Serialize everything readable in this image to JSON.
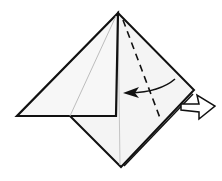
{
  "diagram": {
    "type": "origami-step",
    "colors": {
      "paper": "#f2f2f2",
      "paper_light": "#f7f7f7",
      "outline": "#111111",
      "crease": "#bdbdbd",
      "background": "#ffffff"
    },
    "points": {
      "apex": [
        118,
        13
      ],
      "left_corner": [
        17,
        116
      ],
      "right_corner": [
        194,
        90
      ],
      "bottom": [
        121,
        167
      ],
      "flap_inner_bottom": [
        116,
        116
      ],
      "diamond_left": [
        70,
        116
      ]
    },
    "elements": [
      {
        "name": "diamond-body",
        "kind": "polygon"
      },
      {
        "name": "left-triangle-flap",
        "kind": "polygon"
      },
      {
        "name": "center-crease",
        "kind": "line"
      },
      {
        "name": "flap-crease",
        "kind": "line"
      },
      {
        "name": "valley-fold-dashed-line",
        "kind": "dashed-line"
      },
      {
        "name": "fold-arrow",
        "kind": "curved-arrow"
      },
      {
        "name": "push-arrow",
        "kind": "hollow-arrow"
      }
    ]
  }
}
